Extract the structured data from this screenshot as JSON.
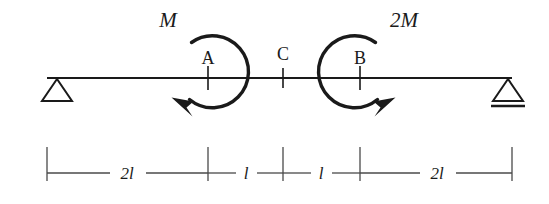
{
  "figure": {
    "name": "simply-supported-beam-with-two-applied-moments",
    "background_color": "#ffffff",
    "line_color": "#1a1a1a",
    "dimension_line_color": "#4a4a4a"
  },
  "beam": {
    "label": "beam",
    "x_start": 47,
    "x_end": 512,
    "y": 78
  },
  "supports": [
    {
      "name": "pin-support-left",
      "type": "pin",
      "apex_x": 57,
      "apex_y": 78,
      "half_width": 15,
      "height": 23,
      "has_base_line": false
    },
    {
      "name": "roller-support-right",
      "type": "roller",
      "apex_x": 508,
      "apex_y": 78,
      "half_width": 15,
      "height": 23,
      "has_base_line": true
    }
  ],
  "nodes": [
    {
      "name": "node-a",
      "label": "A",
      "x": 208,
      "label_x": 208,
      "label_y": 64
    },
    {
      "name": "node-c",
      "label": "C",
      "x": 283,
      "label_x": 283,
      "label_y": 60
    },
    {
      "name": "node-b",
      "label": "B",
      "x": 360,
      "label_x": 360,
      "label_y": 64
    }
  ],
  "moments": [
    {
      "name": "moment-at-a",
      "label": "M",
      "magnitude": "M",
      "direction": "counterclockwise",
      "center_x": 217,
      "center_y": 72,
      "radius": 36,
      "label_x": 168,
      "label_y": 27
    },
    {
      "name": "moment-at-b",
      "label": "2M",
      "magnitude": "2M",
      "direction": "clockwise",
      "center_x": 350,
      "center_y": 72,
      "radius": 36,
      "label_x": 404,
      "label_y": 27
    }
  ],
  "dimensions": {
    "line_y": 173,
    "tick_top": 147,
    "tick_bottom": 181,
    "ticks": [
      47,
      208,
      283,
      360,
      512
    ],
    "segments": [
      {
        "name": "dimension-segment-1",
        "label": "2l",
        "x_from": 47,
        "x_to": 208,
        "label_x": 127,
        "label_y": 179
      },
      {
        "name": "dimension-segment-2",
        "label": "l",
        "x_from": 208,
        "x_to": 283,
        "label_x": 246,
        "label_y": 179
      },
      {
        "name": "dimension-segment-3",
        "label": "l",
        "x_from": 283,
        "x_to": 360,
        "label_x": 321,
        "label_y": 179
      },
      {
        "name": "dimension-segment-4",
        "label": "2l",
        "x_from": 360,
        "x_to": 512,
        "label_x": 437,
        "label_y": 179
      }
    ]
  }
}
